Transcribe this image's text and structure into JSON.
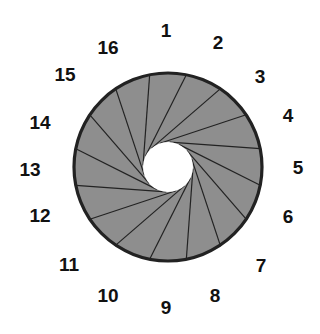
{
  "diagram": {
    "type": "numbered-scalloped-ring",
    "segment_count": 16,
    "center": [
      168,
      167
    ],
    "ring_radius": 94,
    "hole_radius": 25,
    "colors": {
      "ring_fill": "#8e8e8e",
      "scallop_fill": "#d8d8d8",
      "stroke": "#222222",
      "hole": "#ffffff"
    },
    "labels": [
      {
        "text": "1",
        "x": 166,
        "y": 30
      },
      {
        "text": "2",
        "x": 218,
        "y": 42
      },
      {
        "text": "3",
        "x": 260,
        "y": 76
      },
      {
        "text": "4",
        "x": 288,
        "y": 115
      },
      {
        "text": "5",
        "x": 298,
        "y": 167
      },
      {
        "text": "6",
        "x": 288,
        "y": 216
      },
      {
        "text": "7",
        "x": 261,
        "y": 265
      },
      {
        "text": "8",
        "x": 215,
        "y": 295
      },
      {
        "text": "9",
        "x": 166,
        "y": 307
      },
      {
        "text": "10",
        "x": 108,
        "y": 295
      },
      {
        "text": "11",
        "x": 69,
        "y": 264
      },
      {
        "text": "12",
        "x": 40,
        "y": 215
      },
      {
        "text": "13",
        "x": 30,
        "y": 169
      },
      {
        "text": "14",
        "x": 40,
        "y": 122
      },
      {
        "text": "15",
        "x": 65,
        "y": 74
      },
      {
        "text": "16",
        "x": 108,
        "y": 47
      }
    ]
  }
}
